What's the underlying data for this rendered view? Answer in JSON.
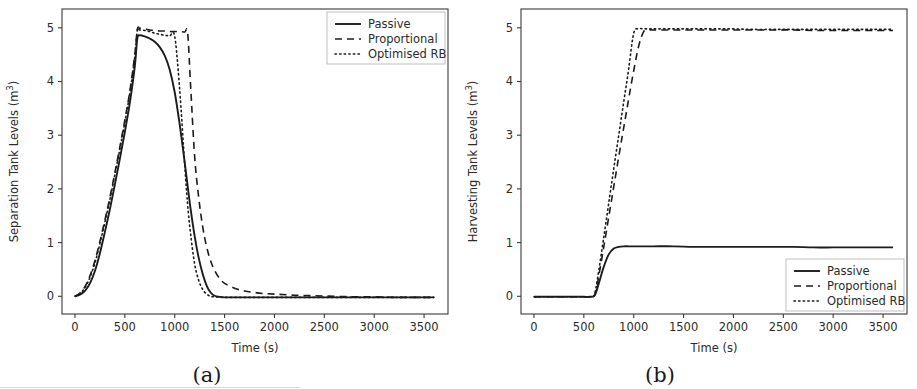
{
  "figure": {
    "background_color": "#ffffff",
    "line_color": "#1c1c1c",
    "axis_color": "#3a3a3a",
    "panels": [
      {
        "caption": "(a)",
        "legend_position": "upper right"
      },
      {
        "caption": "(b)",
        "legend_position": "lower right"
      }
    ]
  },
  "chart_data": [
    {
      "type": "line",
      "title": "",
      "xlabel": "Time (s)",
      "ylabel": "Separation Tank Levels (m³)",
      "xlim": [
        -130,
        3740
      ],
      "ylim": [
        -0.33,
        5.35
      ],
      "xticks": [
        0,
        500,
        1000,
        1500,
        2000,
        2500,
        3000,
        3500
      ],
      "xticklabels": [
        "0",
        "500",
        "1000",
        "1500",
        "2000",
        "2500",
        "3000",
        "3500"
      ],
      "yticks": [
        0,
        1,
        2,
        3,
        4,
        5
      ],
      "yticklabels": [
        "0",
        "1",
        "2",
        "3",
        "4",
        "5"
      ],
      "grid": false,
      "legend": [
        "Passive",
        "Proportional",
        "Optimised RB"
      ],
      "x": [
        0,
        50,
        100,
        150,
        200,
        250,
        300,
        350,
        400,
        450,
        500,
        550,
        600,
        625,
        650,
        700,
        750,
        800,
        850,
        900,
        950,
        1000,
        1050,
        1100,
        1130,
        1160,
        1200,
        1240,
        1280,
        1320,
        1360,
        1400,
        1450,
        1500,
        1600,
        1700,
        1800,
        1900,
        2000,
        2200,
        2400,
        2600,
        2800,
        3000,
        3200,
        3400,
        3600
      ],
      "series": [
        {
          "name": "Passive",
          "style": "solid",
          "values": [
            0.0,
            0.03,
            0.1,
            0.24,
            0.47,
            0.8,
            1.2,
            1.62,
            2.08,
            2.56,
            3.06,
            3.6,
            4.28,
            4.8,
            4.86,
            4.84,
            4.8,
            4.74,
            4.64,
            4.48,
            4.22,
            3.8,
            3.2,
            2.5,
            2.05,
            1.62,
            1.12,
            0.72,
            0.42,
            0.2,
            0.07,
            0.01,
            -0.01,
            -0.02,
            -0.02,
            -0.02,
            -0.02,
            -0.02,
            -0.02,
            -0.02,
            -0.02,
            -0.02,
            -0.02,
            -0.02,
            -0.02,
            -0.02,
            -0.02
          ]
        },
        {
          "name": "Proportional",
          "style": "dashed",
          "values": [
            0.0,
            0.06,
            0.18,
            0.38,
            0.66,
            1.02,
            1.42,
            1.84,
            2.3,
            2.78,
            3.28,
            3.82,
            4.5,
            4.97,
            4.99,
            4.98,
            4.96,
            4.95,
            4.94,
            4.94,
            4.93,
            4.93,
            4.93,
            4.92,
            4.9,
            3.9,
            2.6,
            1.85,
            1.3,
            0.92,
            0.66,
            0.48,
            0.33,
            0.24,
            0.15,
            0.1,
            0.07,
            0.05,
            0.04,
            0.02,
            0.01,
            0.0,
            -0.01,
            -0.01,
            -0.02,
            -0.02,
            -0.02
          ]
        },
        {
          "name": "Optimised RB",
          "style": "dotted",
          "values": [
            0.0,
            0.05,
            0.16,
            0.35,
            0.62,
            0.98,
            1.38,
            1.8,
            2.26,
            2.74,
            3.24,
            3.78,
            4.46,
            4.95,
            4.96,
            4.95,
            4.93,
            4.9,
            4.88,
            4.86,
            4.85,
            4.84,
            3.85,
            2.45,
            1.7,
            1.15,
            0.6,
            0.3,
            0.13,
            0.04,
            0.0,
            -0.01,
            -0.02,
            -0.02,
            -0.02,
            -0.02,
            -0.02,
            -0.02,
            -0.02,
            -0.02,
            -0.02,
            -0.02,
            -0.02,
            -0.02,
            -0.02,
            -0.02,
            -0.02
          ]
        }
      ]
    },
    {
      "type": "line",
      "title": "",
      "xlabel": "Time (s)",
      "ylabel": "Harvesting Tank Levels (m³)",
      "xlim": [
        -130,
        3740
      ],
      "ylim": [
        -0.33,
        5.35
      ],
      "xticks": [
        0,
        500,
        1000,
        1500,
        2000,
        2500,
        3000,
        3500
      ],
      "xticklabels": [
        "0",
        "500",
        "1000",
        "1500",
        "2000",
        "2500",
        "3000",
        "3500"
      ],
      "yticks": [
        0,
        1,
        2,
        3,
        4,
        5
      ],
      "yticklabels": [
        "0",
        "1",
        "2",
        "3",
        "4",
        "5"
      ],
      "grid": false,
      "legend": [
        "Passive",
        "Proportional",
        "Optimised RB"
      ],
      "x": [
        0,
        100,
        200,
        300,
        400,
        500,
        560,
        600,
        620,
        650,
        700,
        750,
        800,
        850,
        900,
        950,
        1000,
        1050,
        1100,
        1150,
        1200,
        1400,
        1600,
        1800,
        2000,
        2200,
        2400,
        2600,
        2800,
        3000,
        3200,
        3400,
        3600
      ],
      "series": [
        {
          "name": "Passive",
          "style": "solid",
          "values": [
            -0.01,
            -0.01,
            -0.01,
            -0.01,
            -0.01,
            -0.01,
            -0.01,
            0.0,
            0.06,
            0.24,
            0.55,
            0.78,
            0.89,
            0.92,
            0.93,
            0.93,
            0.93,
            0.93,
            0.93,
            0.93,
            0.93,
            0.93,
            0.92,
            0.92,
            0.92,
            0.92,
            0.92,
            0.92,
            0.91,
            0.91,
            0.91,
            0.91,
            0.91
          ]
        },
        {
          "name": "Proportional",
          "style": "dashed",
          "values": [
            -0.01,
            -0.01,
            -0.01,
            -0.01,
            -0.01,
            -0.01,
            -0.01,
            0.0,
            0.1,
            0.38,
            0.92,
            1.48,
            2.04,
            2.6,
            3.14,
            3.68,
            4.2,
            4.66,
            4.93,
            4.96,
            4.96,
            4.96,
            4.96,
            4.96,
            4.96,
            4.96,
            4.96,
            4.96,
            4.95,
            4.95,
            4.95,
            4.95,
            4.95
          ]
        },
        {
          "name": "Optimised RB",
          "style": "dotted",
          "values": [
            -0.01,
            -0.01,
            -0.01,
            -0.01,
            -0.01,
            -0.01,
            -0.01,
            0.0,
            0.14,
            0.48,
            1.1,
            1.74,
            2.38,
            3.0,
            3.62,
            4.24,
            4.9,
            4.98,
            4.98,
            4.98,
            4.98,
            4.98,
            4.98,
            4.98,
            4.98,
            4.97,
            4.97,
            4.97,
            4.97,
            4.97,
            4.97,
            4.97,
            4.97
          ]
        }
      ]
    }
  ]
}
